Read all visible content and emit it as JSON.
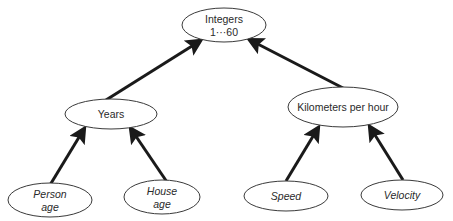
{
  "diagram": {
    "type": "hierarchy",
    "colors": {
      "stroke": "#1a1a1a",
      "ellipse_border": "#3a3a3a",
      "text": "#2a2a2a",
      "background": "#ffffff"
    },
    "nodes": [
      {
        "id": "integers",
        "lines": [
          "Integers",
          "1···60"
        ],
        "italic": false,
        "cx": 224,
        "cy": 25,
        "rx": 42,
        "ry": 17
      },
      {
        "id": "years",
        "lines": [
          "Years"
        ],
        "italic": false,
        "cx": 111,
        "cy": 114,
        "rx": 46,
        "ry": 15
      },
      {
        "id": "kmh",
        "lines": [
          "Kilometers per hour"
        ],
        "italic": false,
        "cx": 343,
        "cy": 107,
        "rx": 55,
        "ry": 20
      },
      {
        "id": "person_age",
        "lines": [
          "Person",
          "age"
        ],
        "italic": true,
        "cx": 50,
        "cy": 200,
        "rx": 42,
        "ry": 17
      },
      {
        "id": "house_age",
        "lines": [
          "House",
          "age"
        ],
        "italic": true,
        "cx": 162,
        "cy": 197,
        "rx": 38,
        "ry": 17
      },
      {
        "id": "speed",
        "lines": [
          "Speed"
        ],
        "italic": true,
        "cx": 286,
        "cy": 196,
        "rx": 42,
        "ry": 15
      },
      {
        "id": "velocity",
        "lines": [
          "Velocity"
        ],
        "italic": true,
        "cx": 402,
        "cy": 195,
        "rx": 41,
        "ry": 15
      }
    ],
    "edges": [
      {
        "from": "years",
        "to": "integers",
        "x1": 106,
        "y1": 100,
        "x2": 200,
        "y2": 41
      },
      {
        "from": "kmh",
        "to": "integers",
        "x1": 343,
        "y1": 88,
        "x2": 250,
        "y2": 40
      },
      {
        "from": "person_age",
        "to": "years",
        "x1": 50,
        "y1": 185,
        "x2": 84,
        "y2": 129
      },
      {
        "from": "house_age",
        "to": "years",
        "x1": 167,
        "y1": 182,
        "x2": 131,
        "y2": 129
      },
      {
        "from": "speed",
        "to": "kmh",
        "x1": 286,
        "y1": 181,
        "x2": 318,
        "y2": 128
      },
      {
        "from": "velocity",
        "to": "kmh",
        "x1": 403,
        "y1": 180,
        "x2": 370,
        "y2": 127
      }
    ]
  }
}
